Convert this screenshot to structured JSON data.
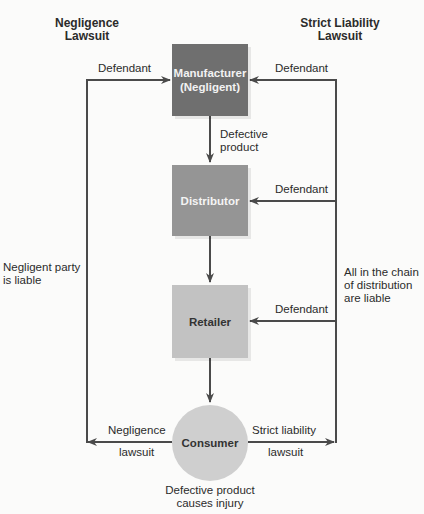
{
  "headers": {
    "left": [
      "Negligence",
      "Lawsuit"
    ],
    "right": [
      "Strict Liability",
      "Lawsuit"
    ]
  },
  "nodes": {
    "manufacturer": [
      "Manufacturer",
      "(Negligent)"
    ],
    "distributor": "Distributor",
    "retailer": "Retailer",
    "consumer": "Consumer"
  },
  "labels": {
    "defendant_left": "Defendant",
    "defendant_right_1": "Defendant",
    "defendant_right_2": "Defendant",
    "defendant_right_3": "Defendant",
    "defective_product": [
      "Defective",
      "product"
    ],
    "negligent_party": [
      "Negligent party",
      "is liable"
    ],
    "chain_liable": [
      "All in the chain",
      "of distribution",
      "are liable"
    ],
    "negligence_lawsuit": [
      "Negligence",
      "lawsuit"
    ],
    "strict_liability_lawsuit": [
      "Strict liability",
      "lawsuit"
    ],
    "injury": [
      "Defective product",
      "causes injury"
    ]
  },
  "colors": {
    "manufacturer": "#6f6f6f",
    "distributor": "#959595",
    "retailer": "#c2c2c2",
    "consumer": "#cfcfcf",
    "line": "#4a4a4a"
  }
}
